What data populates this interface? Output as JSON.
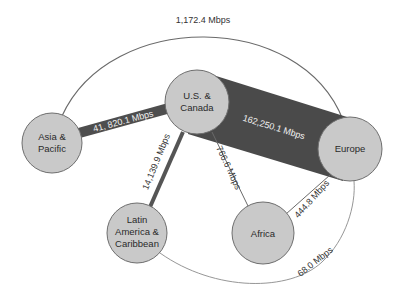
{
  "diagram": {
    "colors": {
      "background": "#ffffff",
      "node_fill": "#c9c9c9",
      "node_stroke": "#6e6e6e",
      "heavy_link": "#4a4a4a",
      "medium_link": "#555555",
      "thin_link": "#6a6a6a",
      "arc_link": "#7a7a7a"
    },
    "nodes": [
      {
        "id": "asia",
        "lines": [
          "Asia &",
          "Pacific"
        ]
      },
      {
        "id": "us",
        "lines": [
          "U.S. &",
          "Canada"
        ]
      },
      {
        "id": "europe",
        "lines": [
          "Europe"
        ]
      },
      {
        "id": "latam",
        "lines": [
          "Latin",
          "America &",
          "Caribbean"
        ]
      },
      {
        "id": "africa",
        "lines": [
          "Africa"
        ]
      }
    ],
    "links": [
      {
        "from": "us",
        "to": "europe",
        "label": "162,250.1 Mbps"
      },
      {
        "from": "asia",
        "to": "us",
        "label": "41, 820.1 Mbps"
      },
      {
        "from": "us",
        "to": "latam",
        "label": "14,139.9 Mbps"
      },
      {
        "from": "asia",
        "to": "europe",
        "label": "1,172.4 Mbps"
      },
      {
        "from": "us",
        "to": "africa",
        "label": "766.6 Mbps"
      },
      {
        "from": "africa",
        "to": "europe",
        "label": "444.8 Mbps"
      },
      {
        "from": "latam",
        "to": "europe",
        "label": "68.0 Mbps"
      }
    ]
  }
}
